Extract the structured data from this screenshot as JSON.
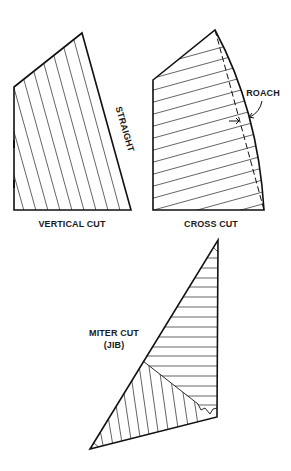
{
  "figure": {
    "colors": {
      "ink": "#111111",
      "background": "#ffffff"
    }
  },
  "sails": [
    {
      "id": "vertical-cut",
      "label": "VERTICAL CUT",
      "leech_label": "STRAIGHT",
      "panel_orientation": "vertical (parallel to leech)"
    },
    {
      "id": "cross-cut",
      "label": "CROSS CUT",
      "leech_label": "ROACH",
      "panel_orientation": "horizontal (perpendicular to leech)"
    },
    {
      "id": "miter-cut",
      "label_line1": "MITER CUT",
      "label_line2": "(JIB)",
      "panel_orientation": "horizontal above miter seam, perpendicular-to-foot below"
    }
  ]
}
